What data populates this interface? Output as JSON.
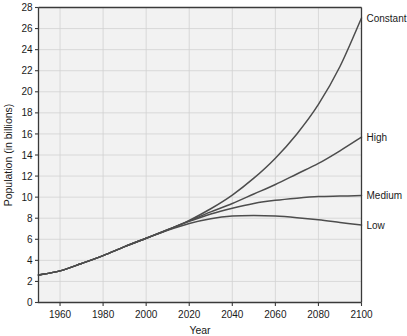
{
  "chart_data": {
    "type": "line",
    "title": "",
    "xlabel": "Year",
    "ylabel": "Population (in billions)",
    "xlim": [
      1950,
      2100
    ],
    "ylim": [
      0,
      28
    ],
    "xticks": [
      1960,
      1980,
      2000,
      2020,
      2040,
      2060,
      2080,
      2100
    ],
    "yticks": [
      0,
      2,
      4,
      6,
      8,
      10,
      12,
      14,
      16,
      18,
      20,
      22,
      24,
      26,
      28
    ],
    "grid": true,
    "legend_position": "right-of-plot-inline",
    "x": [
      1950,
      1960,
      1970,
      1980,
      1990,
      2000,
      2010,
      2020,
      2030,
      2040,
      2050,
      2060,
      2070,
      2080,
      2090,
      2100
    ],
    "series": [
      {
        "name": "Constant",
        "label": "Constant",
        "color": "#4d4d4d",
        "values": [
          2.6,
          3.0,
          3.7,
          4.45,
          5.3,
          6.1,
          6.9,
          7.8,
          8.9,
          10.2,
          11.8,
          13.7,
          16.0,
          18.8,
          22.4,
          27.0
        ]
      },
      {
        "name": "High",
        "label": "High",
        "color": "#4d4d4d",
        "values": [
          2.6,
          3.0,
          3.7,
          4.45,
          5.3,
          6.1,
          6.9,
          7.75,
          8.6,
          9.4,
          10.3,
          11.2,
          12.2,
          13.2,
          14.4,
          15.7
        ]
      },
      {
        "name": "Medium",
        "label": "Medium",
        "color": "#4d4d4d",
        "values": [
          2.6,
          3.0,
          3.7,
          4.45,
          5.3,
          6.1,
          6.9,
          7.7,
          8.4,
          8.95,
          9.4,
          9.7,
          9.9,
          10.05,
          10.1,
          10.15
        ]
      },
      {
        "name": "Low",
        "label": "Low",
        "color": "#4d4d4d",
        "values": [
          2.6,
          3.0,
          3.7,
          4.45,
          5.3,
          6.1,
          6.85,
          7.5,
          7.95,
          8.2,
          8.25,
          8.2,
          8.05,
          7.85,
          7.6,
          7.35
        ]
      }
    ]
  },
  "axis": {
    "y_tick_labels": [
      "0",
      "2",
      "4",
      "6",
      "8",
      "10",
      "12",
      "14",
      "16",
      "18",
      "20",
      "22",
      "24",
      "26",
      "28"
    ],
    "x_tick_labels": [
      "1960",
      "1980",
      "2000",
      "2020",
      "2040",
      "2060",
      "2080",
      "2100"
    ],
    "x_title": "Year",
    "y_title": "Population (in billions)"
  },
  "labels": {
    "constant": "Constant",
    "high": "High",
    "medium": "Medium",
    "low": "Low"
  },
  "colors": {
    "line": "#4d4d4d",
    "axis": "#3a3a3a",
    "grid": "#d2d2d2",
    "plot_background": "#f2f2f2",
    "page_background": "#ffffff",
    "text": "#1a1a1a"
  }
}
